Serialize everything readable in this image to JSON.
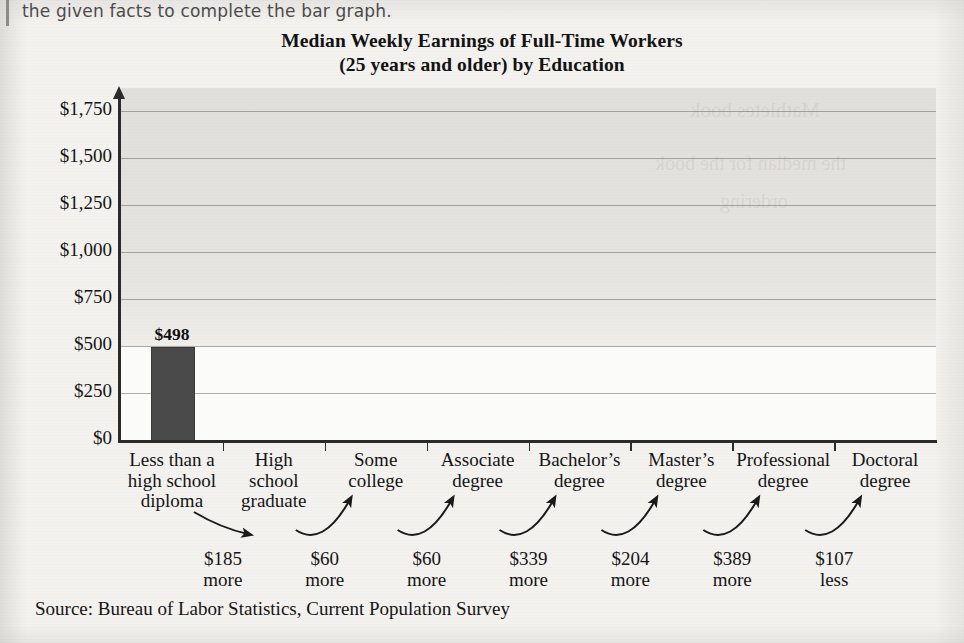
{
  "page": {
    "stem_text": "the given facts to complete the bar graph.",
    "source_note": "Source: Bureau of Labor Statistics, Current Population Survey"
  },
  "chart_data": {
    "type": "bar",
    "title": "Median Weekly Earnings of Full-Time Workers",
    "subtitle": "(25 years and older) by Education",
    "xlabel": "",
    "ylabel": "",
    "ylim": [
      0,
      1875
    ],
    "grid": true,
    "legend": "none",
    "categories": [
      "Less than a high school diploma",
      "High school graduate",
      "Some college",
      "Associate degree",
      "Bachelor's degree",
      "Master's degree",
      "Professional degree",
      "Doctoral degree"
    ],
    "category_lines": [
      [
        "Less than a",
        "high school",
        "diploma"
      ],
      [
        "High",
        "school",
        "graduate"
      ],
      [
        "Some",
        "college"
      ],
      [
        "Associate",
        "degree"
      ],
      [
        "Bachelor’s",
        "degree"
      ],
      [
        "Master’s",
        "degree"
      ],
      [
        "Professional",
        "degree"
      ],
      [
        "Doctoral",
        "degree"
      ]
    ],
    "values": [
      498,
      null,
      null,
      null,
      null,
      null,
      null,
      null
    ],
    "value_labels": [
      "$498",
      "",
      "",
      "",
      "",
      "",
      "",
      ""
    ],
    "yticks": [
      0,
      250,
      500,
      750,
      1000,
      1250,
      1500,
      1750
    ],
    "ytick_labels": [
      "$0",
      "$250",
      "$500",
      "$750",
      "$1,000",
      "$1,250",
      "$1,500",
      "$1,750"
    ],
    "annotations": [
      {
        "amount": "$185",
        "direction": "more"
      },
      {
        "amount": "$60",
        "direction": "more"
      },
      {
        "amount": "$60",
        "direction": "more"
      },
      {
        "amount": "$339",
        "direction": "more"
      },
      {
        "amount": "$204",
        "direction": "more"
      },
      {
        "amount": "$389",
        "direction": "more"
      },
      {
        "amount": "$107",
        "direction": "less"
      }
    ],
    "bar_color": "#4a4a4a",
    "axis_color": "#2b2b2b",
    "grid_color": "#6e6c68"
  },
  "ghost_text": {
    "g1": "Mathletes book",
    "g2": "the median for the book",
    "g3": "ordering"
  }
}
